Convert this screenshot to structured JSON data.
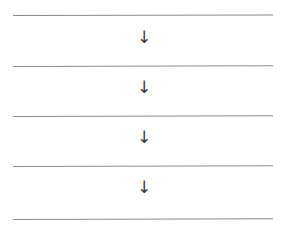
{
  "diagram": {
    "title": "",
    "background_color": "#ffffff",
    "line_color": "#8a8a8a",
    "arrow_color": "#3a3a3a",
    "rules": [
      {
        "id": "rule-1",
        "label": ""
      },
      {
        "id": "rule-2",
        "label": ""
      },
      {
        "id": "rule-3",
        "label": ""
      },
      {
        "id": "rule-4",
        "label": ""
      },
      {
        "id": "rule-5",
        "label": ""
      }
    ],
    "arrows": [
      {
        "id": "arrow-1",
        "glyph": "↓",
        "icon": "arrow-down-icon"
      },
      {
        "id": "arrow-2",
        "glyph": "↓",
        "icon": "arrow-down-icon"
      },
      {
        "id": "arrow-3",
        "glyph": "↓",
        "icon": "arrow-down-icon"
      },
      {
        "id": "arrow-4",
        "glyph": "↓",
        "icon": "arrow-down-icon"
      }
    ]
  }
}
